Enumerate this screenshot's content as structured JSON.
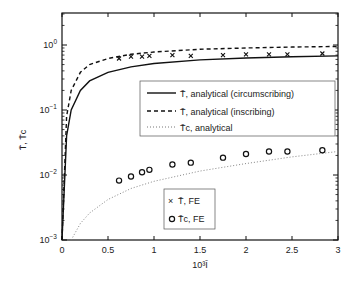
{
  "chart_data": {
    "type": "line",
    "title": "",
    "xlabel": "10³ Ī",
    "ylabel": "T̄, T̄c",
    "xlim": [
      0,
      3
    ],
    "ylim": [
      0.001,
      3.16
    ],
    "yscale": "log",
    "grid": false,
    "x_ticks": [
      "0",
      "0.5",
      "1",
      "1.5",
      "2",
      "2.5",
      "3"
    ],
    "y_ticks": [
      "10^0",
      "10^-1",
      "10^-2",
      "10^-3"
    ],
    "legend_upper": [
      {
        "label": "T̄, analytical (circumscribing)",
        "style": "solid"
      },
      {
        "label": "T̄, analytical (inscribing)",
        "style": "dashed"
      },
      {
        "label": "T̄c, analytical",
        "style": "dotted"
      }
    ],
    "legend_lower": [
      {
        "label": "T̄, FE",
        "marker": "x"
      },
      {
        "label": "T̄c, FE",
        "marker": "o"
      }
    ],
    "series": [
      {
        "name": "T̄, analytical (circumscribing)",
        "style": "solid",
        "x": [
          0.0,
          0.05,
          0.1,
          0.2,
          0.3,
          0.5,
          0.75,
          1.0,
          1.5,
          2.0,
          2.5,
          3.0
        ],
        "y": [
          0.001,
          0.04,
          0.1,
          0.2,
          0.28,
          0.38,
          0.46,
          0.52,
          0.59,
          0.63,
          0.66,
          0.68
        ]
      },
      {
        "name": "T̄, analytical (inscribing)",
        "style": "dashed",
        "x": [
          0.0,
          0.05,
          0.1,
          0.2,
          0.3,
          0.5,
          0.75,
          1.0,
          1.5,
          2.0,
          2.5,
          3.0
        ],
        "y": [
          0.001,
          0.08,
          0.2,
          0.38,
          0.5,
          0.62,
          0.72,
          0.78,
          0.86,
          0.9,
          0.93,
          0.95
        ]
      },
      {
        "name": "T̄c, analytical",
        "style": "dotted",
        "x": [
          0.1,
          0.2,
          0.3,
          0.5,
          0.75,
          1.0,
          1.5,
          2.0,
          2.5,
          3.0
        ],
        "y": [
          0.001,
          0.0018,
          0.0026,
          0.0042,
          0.0062,
          0.008,
          0.0115,
          0.015,
          0.019,
          0.023
        ]
      },
      {
        "name": "T̄, FE",
        "marker": "x",
        "x": [
          0.62,
          0.75,
          0.87,
          0.95,
          1.2,
          1.4,
          1.75,
          2.0,
          2.25,
          2.45,
          2.83
        ],
        "y": [
          0.62,
          0.66,
          0.66,
          0.68,
          0.7,
          0.68,
          0.7,
          0.72,
          0.72,
          0.72,
          0.74
        ]
      },
      {
        "name": "T̄c, FE",
        "marker": "o",
        "x": [
          0.62,
          0.75,
          0.87,
          0.95,
          1.2,
          1.4,
          1.75,
          2.0,
          2.25,
          2.45,
          2.83
        ],
        "y": [
          0.0082,
          0.0095,
          0.011,
          0.012,
          0.0145,
          0.0155,
          0.0185,
          0.021,
          0.023,
          0.023,
          0.024
        ]
      }
    ]
  },
  "labels": {
    "xlabel": "10³Ī",
    "ylabel": "T̄, T̄c",
    "legend1_0": "T̄, analytical (circumscribing)",
    "legend1_1": "T̄, analytical (inscribing)",
    "legend1_2": "T̄c, analytical",
    "legend2_0": "T̄, FE",
    "legend2_1": "T̄c, FE"
  }
}
